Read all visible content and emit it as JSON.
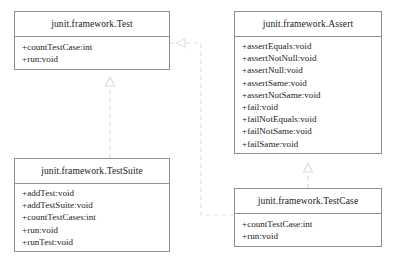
{
  "diagram": {
    "background_color": "#ffffff",
    "border_color": "#8f8f8f",
    "text_color": "#1a1a1a",
    "connector_color": "#d8d8d8",
    "classes": [
      {
        "id": "test",
        "name": "junit.framework.Test",
        "members": [
          "+countTestCase:int",
          "+run:void"
        ]
      },
      {
        "id": "assert",
        "name": "junit.framework.Assert",
        "members": [
          "+assertEquals:void",
          "+assertNotNull:void",
          "+assertNull:void",
          "+assertSame:void",
          "+assertNotSame:void",
          "+fail:void",
          "+failNotEquals:void",
          "+failNotSame:void",
          "+failSame:void"
        ]
      },
      {
        "id": "testsuite",
        "name": "junit.framework.TestSuite",
        "members": [
          "+addTest:void",
          "+addTestSuite:void",
          "+countTestCases:int",
          "+run:void",
          "+runTest:void"
        ]
      },
      {
        "id": "testcase",
        "name": "junit.framework.TestCase",
        "members": [
          "+countTestCase:int",
          "+run:void"
        ]
      }
    ],
    "relationships": [
      {
        "id": "testsuite-realizes-test",
        "type": "realization",
        "from": "junit.framework.TestSuite",
        "to": "junit.framework.Test",
        "style": "dashed",
        "arrowhead": "hollow-triangle"
      },
      {
        "id": "testcase-realizes-test",
        "type": "realization",
        "from": "junit.framework.TestCase",
        "to": "junit.framework.Test",
        "style": "dashed",
        "arrowhead": "hollow-triangle"
      },
      {
        "id": "testcase-extends-assert",
        "type": "generalization",
        "from": "junit.framework.TestCase",
        "to": "junit.framework.Assert",
        "style": "dashed",
        "arrowhead": "hollow-triangle"
      }
    ]
  }
}
